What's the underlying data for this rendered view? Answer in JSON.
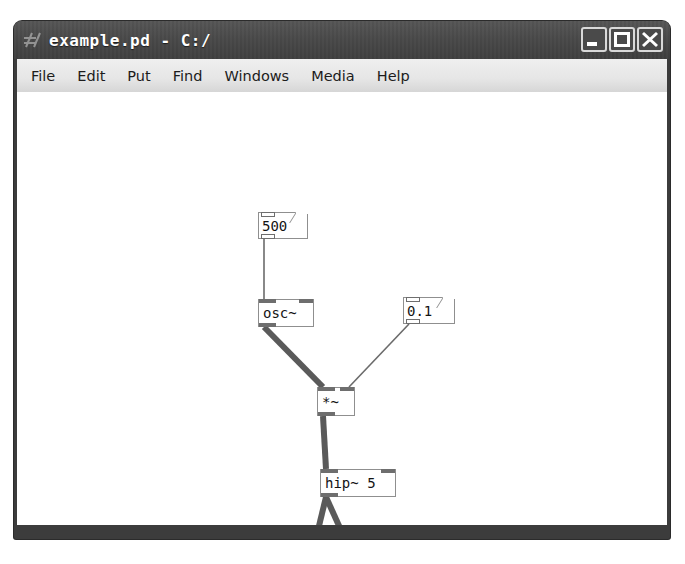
{
  "window": {
    "title": "example.pd - C:/",
    "app_icon": "pd-logo-icon",
    "buttons": {
      "minimize": "minimize-button",
      "maximize": "maximize-button",
      "close": "close-button"
    }
  },
  "menubar": {
    "items": [
      {
        "label": "File"
      },
      {
        "label": "Edit"
      },
      {
        "label": "Put"
      },
      {
        "label": "Find"
      },
      {
        "label": "Windows"
      },
      {
        "label": "Media"
      },
      {
        "label": "Help"
      }
    ]
  },
  "patch": {
    "objects": [
      {
        "id": "num-500",
        "kind": "number-box",
        "text": "500",
        "x": 241,
        "y": 120,
        "w": 50,
        "h": 27,
        "inlets": 1,
        "outlets": 1
      },
      {
        "id": "osc",
        "kind": "object-box",
        "text": "osc~",
        "x": 241,
        "y": 207,
        "w": 56,
        "h": 28,
        "inlets": 2,
        "outlets": 1
      },
      {
        "id": "num-01",
        "kind": "number-box",
        "text": "0.1",
        "x": 386,
        "y": 205,
        "w": 52,
        "h": 27,
        "inlets": 1,
        "outlets": 1
      },
      {
        "id": "times",
        "kind": "object-box",
        "text": "*~",
        "x": 300,
        "y": 295,
        "w": 38,
        "h": 29,
        "inlets": 2,
        "outlets": 1
      },
      {
        "id": "hip",
        "kind": "object-box",
        "text": "hip~ 5",
        "x": 303,
        "y": 377,
        "w": 76,
        "h": 28,
        "inlets": 2,
        "outlets": 1
      },
      {
        "id": "dac",
        "kind": "object-box",
        "text": "dac~",
        "x": 288,
        "y": 467,
        "w": 56,
        "h": 28,
        "inlets": 2,
        "outlets": 0
      }
    ],
    "connections": [
      {
        "from": "num-500",
        "from_outlet": 0,
        "to": "osc",
        "to_inlet": 0,
        "type": "message",
        "points": "247,147 247,207"
      },
      {
        "from": "osc",
        "from_outlet": 0,
        "to": "times",
        "to_inlet": 0,
        "type": "signal",
        "points": "247,235 306,295"
      },
      {
        "from": "num-01",
        "from_outlet": 0,
        "to": "times",
        "to_inlet": 1,
        "type": "message",
        "points": "392,232 332,295"
      },
      {
        "from": "times",
        "from_outlet": 0,
        "to": "hip",
        "to_inlet": 0,
        "type": "signal",
        "points": "306,324 309,377"
      },
      {
        "from": "hip",
        "from_outlet": 0,
        "to": "dac",
        "to_inlet": 0,
        "type": "signal",
        "points": "309,405 294,467"
      },
      {
        "from": "hip",
        "from_outlet": 0,
        "to": "dac",
        "to_inlet": 1,
        "type": "signal",
        "points": "309,405 337,467"
      }
    ],
    "cord_colors": {
      "signal": "#5a5a5a",
      "message": "#6b6b6b"
    },
    "cord_widths": {
      "signal": 6,
      "message": 1.6
    }
  }
}
